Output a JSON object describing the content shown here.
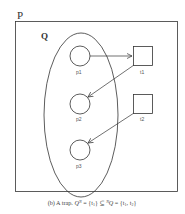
{
  "diagram": {
    "outer_label": "P",
    "set_label": "Q",
    "places": [
      {
        "id": "p1",
        "label": "p1",
        "cx": 80,
        "cy": 56
      },
      {
        "id": "p2",
        "label": "p2",
        "cx": 80,
        "cy": 104
      },
      {
        "id": "p3",
        "label": "p3",
        "cx": 80,
        "cy": 150
      }
    ],
    "transitions": [
      {
        "id": "t1",
        "label": "t1",
        "x": 133,
        "y": 46
      },
      {
        "id": "t2",
        "label": "t2",
        "x": 133,
        "y": 94
      }
    ],
    "arcs": [
      {
        "from": "p1",
        "to": "t1"
      },
      {
        "from": "t1",
        "to": "p2"
      },
      {
        "from": "t2",
        "to": "p3"
      }
    ],
    "caption": {
      "prefix": "(b) A trap. ",
      "q": "Q",
      "sup1": "N",
      "mid": " = {t",
      "sub1": "1",
      "rel": "} ⊆ ",
      "sup2": "N",
      "q2": "Q",
      "eq2": " = {t",
      "sub2": "1",
      "comma": ", t",
      "sub3": "2",
      "close": "}"
    },
    "colors": {
      "stroke": "#333333",
      "text": "#333333"
    }
  }
}
